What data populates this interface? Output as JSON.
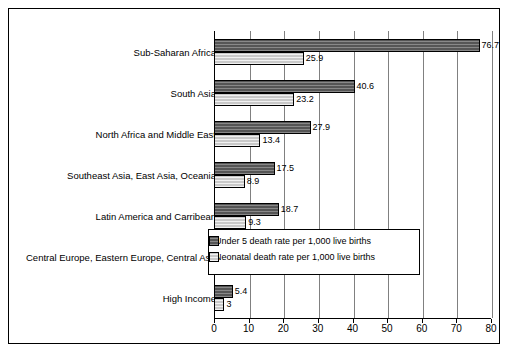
{
  "chart_data": {
    "type": "bar",
    "orientation": "horizontal",
    "title": "",
    "xlabel": "",
    "ylabel": "",
    "xlim": [
      0,
      80
    ],
    "xticks": [
      0,
      10,
      20,
      30,
      40,
      50,
      60,
      70,
      80
    ],
    "grid": true,
    "legend_position": "inside-right-middle",
    "categories": [
      "Sub-Saharan Africa",
      "South Asia",
      "North Africa and Middle East",
      "Southeast Asia, East Asia, Oceania",
      "Latin America and Carribean",
      "Central Europe, Eastern Europe, Central Asia",
      "High Income"
    ],
    "series": [
      {
        "name": "Under 5 death rate per 1,000 live births",
        "color": "#555555",
        "values": [
          76.7,
          40.6,
          27.9,
          17.5,
          18.7,
          13.6,
          5.4
        ]
      },
      {
        "name": "Neonatal death rate per 1,000 live births",
        "color": "#c9c9c9",
        "values": [
          25.9,
          23.2,
          13.4,
          8.9,
          9.3,
          7,
          3
        ]
      }
    ]
  },
  "legend": {
    "items": [
      {
        "label": "Under 5 death rate per 1,000 live births"
      },
      {
        "label": "Neonatal death rate per 1,000 live births"
      }
    ]
  }
}
